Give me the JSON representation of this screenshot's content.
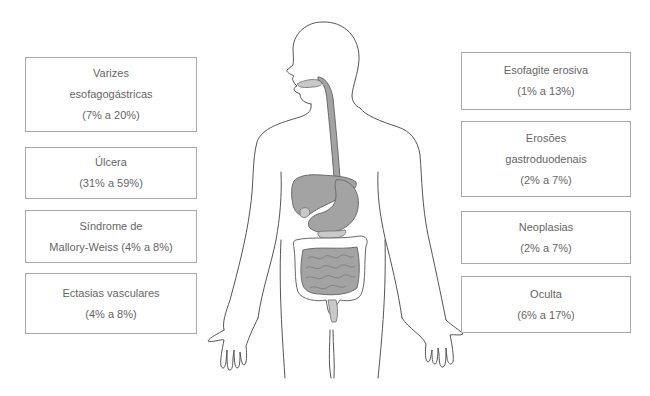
{
  "left_boxes": [
    {
      "lines": [
        "Varizes",
        "esofagogástricas",
        "(7% a 20%)"
      ]
    },
    {
      "lines": [
        "Úlcera",
        "(31% a 59%)"
      ]
    },
    {
      "lines": [
        "Síndrome de",
        "Mallory-Weiss (4% a 8%)"
      ]
    },
    {
      "lines": [
        "Ectasias vasculares",
        "(4% a 8%)"
      ]
    }
  ],
  "right_boxes": [
    {
      "lines": [
        "Esofagite erosiva",
        "(1% a 13%)"
      ]
    },
    {
      "lines": [
        "Erosões",
        "gastroduodenais",
        "(2% a 7%)"
      ]
    },
    {
      "lines": [
        "Neoplasias",
        "(2% a 7%)"
      ]
    },
    {
      "lines": [
        "Oculta",
        "(6% a 17%)"
      ]
    }
  ],
  "figure": {
    "label": "human-body-digestive-tract-illustration",
    "organ_color": "#a3a3a3",
    "outline_color": "#555555"
  }
}
